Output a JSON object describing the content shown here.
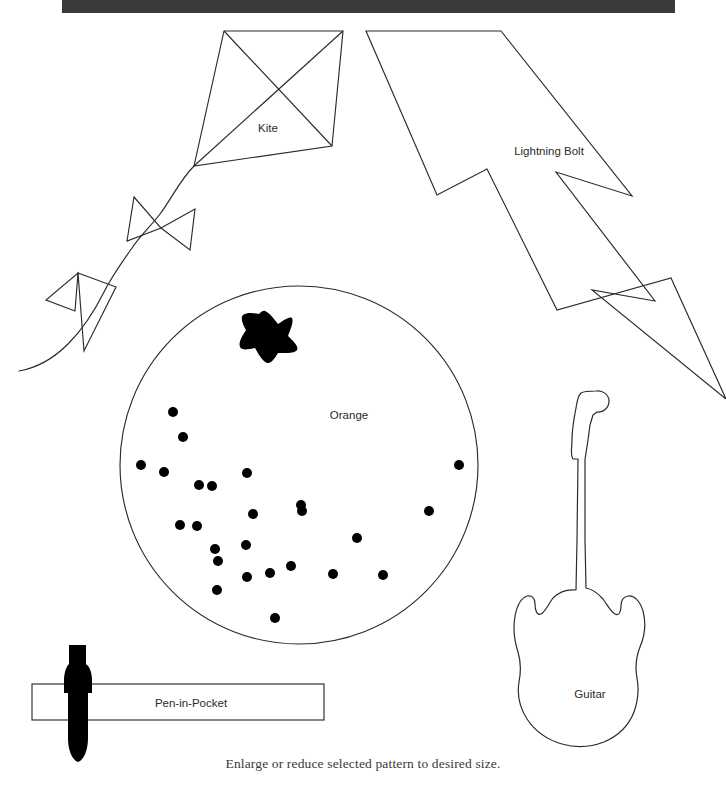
{
  "page": {
    "background_color": "#ffffff",
    "ink_color": "#2b2b2b",
    "caption": "Enlarge or reduce selected pattern to desired size."
  },
  "top_bar": {
    "name": "page-header-bar",
    "color": "#3b3b3b",
    "x": 62,
    "y": 0,
    "width": 613,
    "height": 13
  },
  "patterns": [
    {
      "id": "kite",
      "label": "Kite",
      "label_x": 268,
      "label_y": 132,
      "type": "outline",
      "description": "Diamond kite with cross struts and curling tail with two bow-ties"
    },
    {
      "id": "lightning-bolt",
      "label": "Lightning Bolt",
      "label_x": 549,
      "label_y": 155,
      "type": "outline",
      "description": "Zig-zag lightning bolt silhouette"
    },
    {
      "id": "orange",
      "label": "Orange",
      "label_x": 349,
      "label_y": 419,
      "type": "outline",
      "description": "Circle with filled star and scattered seed dots"
    },
    {
      "id": "guitar",
      "label": "Guitar",
      "label_x": 590,
      "label_y": 698,
      "type": "outline",
      "description": "Electric guitar body and neck silhouette"
    },
    {
      "id": "pen-in-pocket",
      "label": "Pen-in-Pocket",
      "label_x": 191,
      "label_y": 707,
      "type": "outline",
      "description": "Rectangular pocket band with filled pen crossing it"
    }
  ],
  "geometry": {
    "kite": {
      "outline": "M 224,31 L 343,31 L 332,146 L 194,166 Z",
      "struts": "M 224,31 L 332,146 M 343,31 L 194,166",
      "tail": "M 194,166 C 176,183 168,206 150,227 C 132,247 110,268 96,290 C 80,314 48,348 19,370",
      "bow_upper": "M 134,197 L 161,228 L 127,241 Z M 161,228 L 193,209 L 190,248 Z",
      "bow_lower": "M 79,273 L 94,310 L 59,300 Z M 79,273 L 115,288 L 84,350 Z"
    },
    "lightning_bolt": {
      "outline": "M 366,31 L 500,31 L 631,195 L 556,171 L 654,300 L 592,288 L 725,398 L 671,277 L 558,309 L 487,168 L 437,193 L 367,32 Z"
    },
    "orange": {
      "circle": {
        "cx": 299,
        "cy": 465,
        "r": 179
      },
      "star": "M 265,314 L 277,325 L 288,320 L 285,335 L 290,346 L 277,351 L 266,359 L 256,349 L 244,347 L 246,334 L 243,322 Z",
      "seeds": [
        {
          "cx": 173,
          "cy": 412,
          "r": 5
        },
        {
          "cx": 183,
          "cy": 437,
          "r": 5
        },
        {
          "cx": 141,
          "cy": 465,
          "r": 5
        },
        {
          "cx": 164,
          "cy": 472,
          "r": 5
        },
        {
          "cx": 212,
          "cy": 486,
          "r": 5
        },
        {
          "cx": 247,
          "cy": 473,
          "r": 5
        },
        {
          "cx": 199,
          "cy": 505,
          "r": 5
        },
        {
          "cx": 180,
          "cy": 525,
          "r": 5
        },
        {
          "cx": 253,
          "cy": 514,
          "r": 5
        },
        {
          "cx": 246,
          "cy": 545,
          "r": 5
        },
        {
          "cx": 215,
          "cy": 549,
          "r": 5
        },
        {
          "cx": 218,
          "cy": 561,
          "r": 5
        },
        {
          "cx": 247,
          "cy": 577,
          "r": 5
        },
        {
          "cx": 217,
          "cy": 590,
          "r": 5
        },
        {
          "cx": 270,
          "cy": 573,
          "r": 5
        },
        {
          "cx": 275,
          "cy": 618,
          "r": 5
        },
        {
          "cx": 291,
          "cy": 566,
          "r": 5
        },
        {
          "cx": 301,
          "cy": 505,
          "r": 5
        },
        {
          "cx": 302,
          "cy": 511,
          "r": 5
        },
        {
          "cx": 333,
          "cy": 574,
          "r": 5
        },
        {
          "cx": 357,
          "cy": 538,
          "r": 5
        },
        {
          "cx": 383,
          "cy": 575,
          "r": 5
        },
        {
          "cx": 429,
          "cy": 511,
          "r": 5
        },
        {
          "cx": 459,
          "cy": 465,
          "r": 5
        }
      ]
    },
    "guitar": {
      "outline": "M 597,391 C 604,390 609,395 609,401 C 609,407 604,412 598,412 L 593,414 L 590,423 L 588,437 L 586,451 L 584,459 L 578,459 L 573,455 L 572,447 L 573,435 L 575,421 L 577,410 L 578,402 L 581,396 L 586,392 Z M 578,459 L 577,540 L 576,590 M 584,459 L 585,540 L 586,588 M 576,590 C 566,589 559,592 553,598 C 548,604 545,612 541,614 C 537,616 535,610 535,604 C 535,598 532,595 527,596 C 521,598 517,606 515,616 C 513,628 514,640 518,652 C 521,662 521,672 519,682 C 517,694 520,707 527,718 C 535,731 548,740 562,744 C 576,748 591,747 604,741 C 618,735 629,724 634,711 C 638,700 639,688 637,677 C 635,666 636,656 640,646 C 645,634 646,621 643,611 C 640,601 634,595 628,596 C 623,597 621,601 621,606 C 621,612 619,616 615,614 C 611,612 608,605 603,599 C 597,592 591,589 586,588",
      "neck_left_x": 577,
      "neck_right_x": 585
    },
    "pen_in_pocket": {
      "pocket_rect": {
        "x": 32,
        "y": 684,
        "width": 292,
        "height": 36
      },
      "pen": "M 69,648 L 85,648 L 85,666 C 90,669 92,674 92,682 L 92,692 L 89,692 L 89,736 C 89,748 85,758 79,760 C 73,758 69,748 69,736 L 69,692 L 66,692 L 66,682 C 66,674 68,669 69,666 Z"
    }
  }
}
